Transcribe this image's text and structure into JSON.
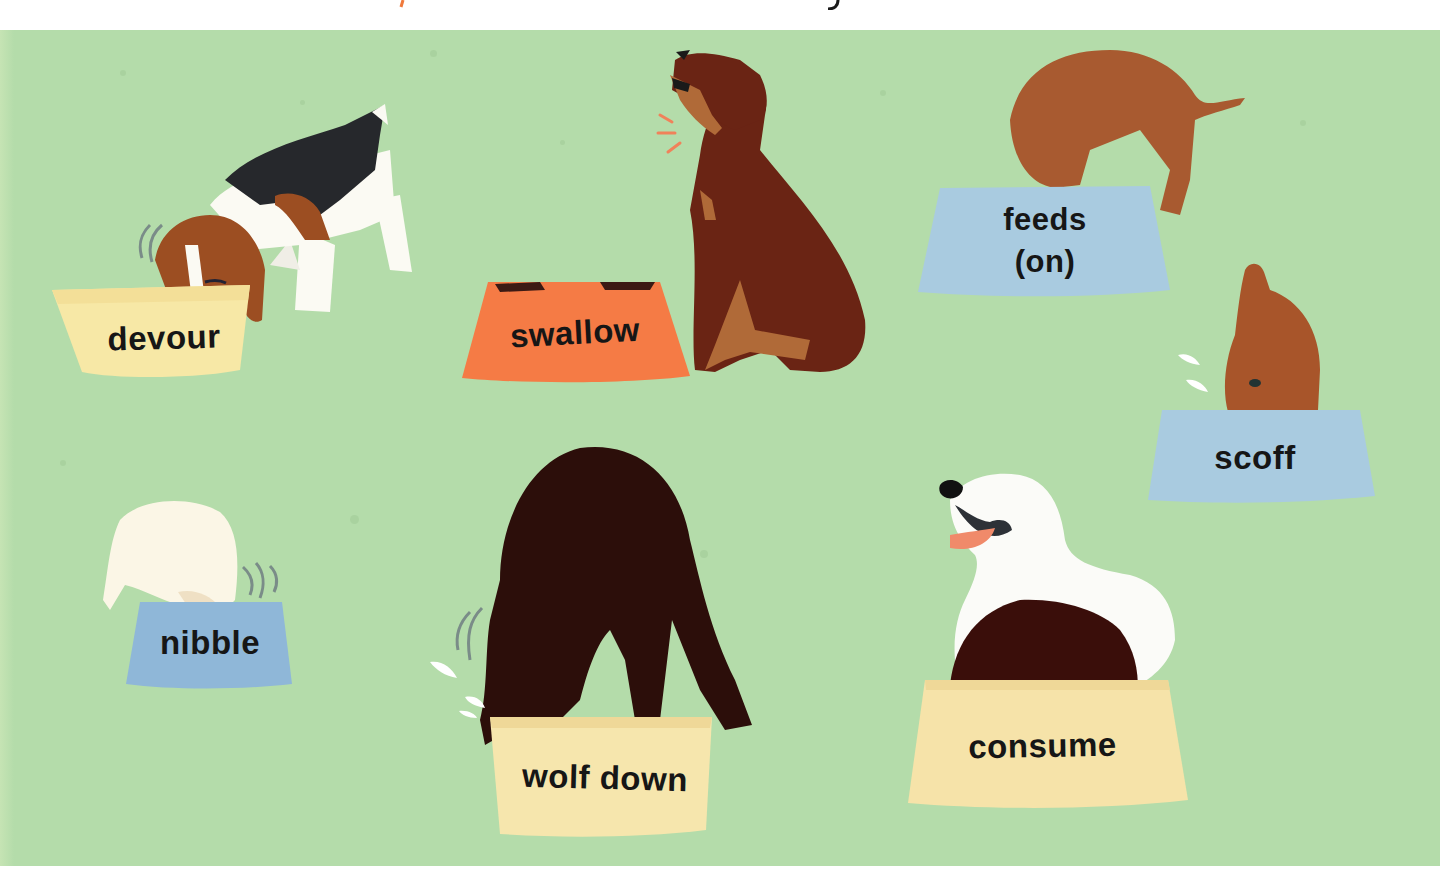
{
  "illustration": {
    "subject": "dogs eating from bowls",
    "background_color": "#b4dcaa",
    "words": [
      {
        "id": "devour",
        "label": "devour",
        "bowl_color": "#f7e8a6",
        "dog": "beagle"
      },
      {
        "id": "swallow",
        "label": "swallow",
        "bowl_color": "#f57b45",
        "dog": "rottweiler"
      },
      {
        "id": "feeds-on",
        "label_line1": "feeds",
        "label_line2": "(on)",
        "bowl_color": "#a9cbe0",
        "dog": "brown hound"
      },
      {
        "id": "scoff",
        "label": "scoff",
        "bowl_color": "#a9cbe0",
        "dog": "poodle"
      },
      {
        "id": "nibble",
        "label": "nibble",
        "bowl_color": "#8fb7d8",
        "dog": "white fluffy dog"
      },
      {
        "id": "wolf-down",
        "label": "wolf down",
        "bowl_color": "#f6e6ad",
        "dog": "black labrador"
      },
      {
        "id": "consume",
        "label": "consume",
        "bowl_color": "#f6e3a9",
        "dog": "white retriever"
      }
    ]
  }
}
